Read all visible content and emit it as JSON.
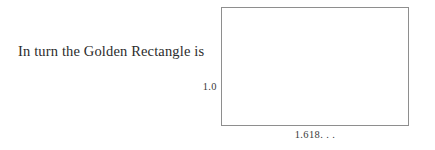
{
  "figure": {
    "caption": "In turn the Golden Rectangle is",
    "rectangle": {
      "height_label": "1.0",
      "width_label": "1.618. . .",
      "stroke_color": "#8e8e8e",
      "fill_color": "#ffffff"
    },
    "text_color": "#2b2b2b",
    "background_color": "#ffffff"
  }
}
